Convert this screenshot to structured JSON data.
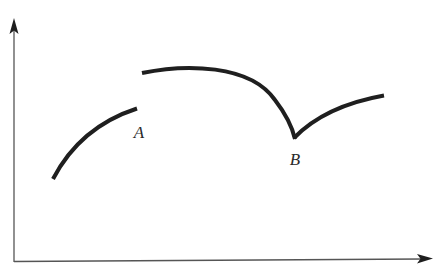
{
  "figure": {
    "colors": {
      "background": "#ffffff",
      "curve": "#1f1f1f",
      "axis": "#555555"
    },
    "axes": {
      "x_axis": {
        "label": "",
        "has_arrow": true
      },
      "y_axis": {
        "label": "",
        "has_arrow": true
      }
    },
    "segments": [
      {
        "name": "left-branch",
        "description": "Concave-down rising arc ending just left of A"
      },
      {
        "name": "middle-branch",
        "description": "Arc starting above A (jump), peaking, then descending to B"
      },
      {
        "name": "right-branch",
        "description": "Concave-down rising arc starting at B"
      }
    ],
    "labels": {
      "point_a": "A",
      "point_b": "B"
    },
    "features": [
      {
        "point": "A",
        "type": "jump discontinuity"
      },
      {
        "point": "B",
        "type": "corner / cusp (not differentiable)"
      }
    ]
  }
}
